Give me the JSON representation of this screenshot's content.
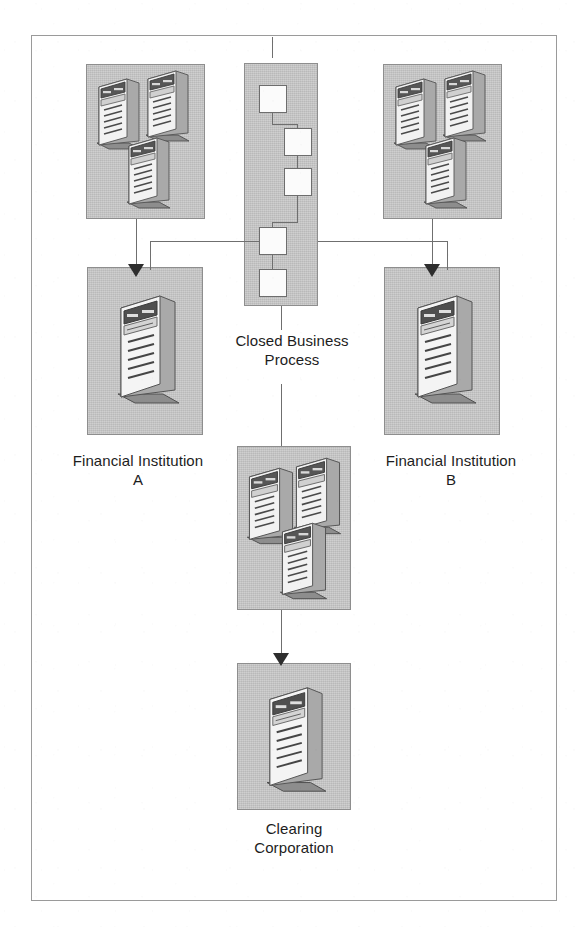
{
  "figure": {
    "frame": {
      "x": 31,
      "y": 35,
      "width": 526,
      "height": 866
    },
    "colors": {
      "panel_fill": "#c6c6c6",
      "panel_border": "#8e8e8e",
      "process_box_fill": "#fbfbfb",
      "process_box_border": "#6d6d6d",
      "connector": "#6f6f6f",
      "arrow_head": "#2e2e2e",
      "label_text": "#1d1d1d",
      "page_background": "#ffffff"
    }
  },
  "labels": [
    {
      "id": "closed-business-process",
      "text": "Closed Business\nProcess",
      "x": 222,
      "y": 330,
      "width": 138
    },
    {
      "id": "financial-institution-a",
      "text": "Financial Institution\nA",
      "x": 32,
      "y": 450,
      "width": 210
    },
    {
      "id": "financial-institution-b",
      "text": "Financial Institution\nB",
      "x": 345,
      "y": 450,
      "width": 210
    },
    {
      "id": "clearing-corporation",
      "text": "Clearing\nCorporation",
      "x": 218,
      "y": 818,
      "width": 150
    }
  ],
  "panels": [
    {
      "id": "fi-a-cluster",
      "name": "Financial Institution A server cluster",
      "x": 85,
      "y": 63,
      "width": 119,
      "height": 155,
      "server_count": 3
    },
    {
      "id": "closed-business-process",
      "name": "Closed Business Process flow panel",
      "x": 243,
      "y": 62,
      "width": 74,
      "height": 243,
      "server_count": 0
    },
    {
      "id": "fi-b-cluster",
      "name": "Financial Institution B server cluster",
      "x": 382,
      "y": 63,
      "width": 119,
      "height": 155,
      "server_count": 3
    },
    {
      "id": "fi-a-main",
      "name": "Financial Institution A primary server",
      "x": 86,
      "y": 266,
      "width": 116,
      "height": 168,
      "server_count": 1
    },
    {
      "id": "fi-b-main",
      "name": "Financial Institution B primary server",
      "x": 383,
      "y": 266,
      "width": 116,
      "height": 168,
      "server_count": 1
    },
    {
      "id": "mid-cluster",
      "name": "Intermediate server cluster",
      "x": 236,
      "y": 445,
      "width": 114,
      "height": 164,
      "server_count": 3
    },
    {
      "id": "clearing-corp",
      "name": "Clearing Corporation server",
      "x": 236,
      "y": 662,
      "width": 114,
      "height": 147,
      "server_count": 1
    }
  ],
  "process_boxes": [
    {
      "id": "step-1",
      "order": 1,
      "x": 258,
      "y": 84,
      "size": 28
    },
    {
      "id": "step-2",
      "order": 2,
      "x": 283,
      "y": 127,
      "size": 28
    },
    {
      "id": "step-3",
      "order": 3,
      "x": 283,
      "y": 167,
      "size": 28
    },
    {
      "id": "step-4",
      "order": 4,
      "x": 258,
      "y": 226,
      "size": 28
    },
    {
      "id": "step-5",
      "order": 5,
      "x": 258,
      "y": 268,
      "size": 28
    }
  ],
  "connections": [
    {
      "id": "cbp-to-fi-a",
      "from": "closed-business-process",
      "to": "fi-a-main",
      "arrow": true
    },
    {
      "id": "cbp-to-fi-b",
      "from": "closed-business-process",
      "to": "fi-b-main",
      "arrow": true
    },
    {
      "id": "fi-a-cluster-to-fi-a-main",
      "from": "fi-a-cluster",
      "to": "fi-a-main",
      "arrow": true
    },
    {
      "id": "fi-b-cluster-to-fi-b-main",
      "from": "fi-b-cluster",
      "to": "fi-b-main",
      "arrow": true
    },
    {
      "id": "cbp-to-mid-cluster",
      "from": "closed-business-process",
      "to": "mid-cluster",
      "arrow": false
    },
    {
      "id": "mid-cluster-to-clearing",
      "from": "mid-cluster",
      "to": "clearing-corp",
      "arrow": true
    }
  ]
}
